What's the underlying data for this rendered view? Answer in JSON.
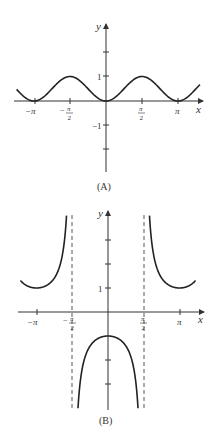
{
  "chart_data": [
    {
      "type": "line",
      "panel_label": "(A)",
      "function": "y = sin^2(x)",
      "xlabel": "x",
      "ylabel": "y",
      "x_ticks": [
        {
          "value": -3.14159,
          "label": "−π"
        },
        {
          "value": -1.5708,
          "label": "−π/2"
        },
        {
          "value": 1.5708,
          "label": "π/2"
        },
        {
          "value": 3.14159,
          "label": "π"
        }
      ],
      "y_ticks": [
        {
          "value": 2,
          "label": ""
        },
        {
          "value": 1,
          "label": "1"
        },
        {
          "value": -1,
          "label": "−1"
        },
        {
          "value": -2,
          "label": ""
        }
      ],
      "xlim": [
        -3.9,
        4.1
      ],
      "ylim": [
        -3,
        3
      ],
      "grid": false,
      "legend": "none",
      "x": [
        -3.9,
        -3.14159,
        -2.356,
        -1.5708,
        -0.785,
        0,
        0.785,
        1.5708,
        2.356,
        3.14159,
        3.9
      ],
      "series": [
        {
          "name": "sin^2 x",
          "values": [
            0.47,
            0,
            0.5,
            1,
            0.5,
            0,
            0.5,
            1,
            0.5,
            0,
            0.47
          ]
        }
      ]
    },
    {
      "type": "line",
      "panel_label": "(B)",
      "function": "y = -sec(x)",
      "xlabel": "x",
      "ylabel": "y",
      "x_ticks": [
        {
          "value": -3.14159,
          "label": "−π"
        },
        {
          "value": -1.5708,
          "label": "−π/2"
        },
        {
          "value": 1.5708,
          "label": "π/2"
        },
        {
          "value": 3.14159,
          "label": "π"
        }
      ],
      "y_ticks": [
        {
          "value": 3,
          "label": ""
        },
        {
          "value": 2,
          "label": ""
        },
        {
          "value": 1,
          "label": "1"
        },
        {
          "value": -2,
          "label": ""
        },
        {
          "value": -3,
          "label": ""
        }
      ],
      "asymptotes_x": [
        -1.5708,
        1.5708
      ],
      "xlim": [
        -3.9,
        4.1
      ],
      "ylim": [
        -4,
        4
      ],
      "grid": false,
      "legend": "none",
      "x": [
        -3.9,
        -3.14159,
        -2.5,
        -2.0,
        -1.8,
        0,
        1.8,
        2.0,
        2.5,
        3.14159,
        3.9
      ],
      "series": [
        {
          "name": "-sec x",
          "values": [
            1.38,
            1,
            1.25,
            2.4,
            4.4,
            -1,
            4.4,
            2.4,
            1.25,
            1,
            1.38
          ]
        }
      ]
    }
  ],
  "labels": {
    "panel_a": "(A)",
    "panel_b": "(B)",
    "x_axis": "x",
    "y_axis": "y",
    "neg_pi": "−π",
    "pi": "π",
    "minus": "−",
    "pi_sym": "π",
    "two": "2",
    "one": "1",
    "neg_one": "−1"
  }
}
